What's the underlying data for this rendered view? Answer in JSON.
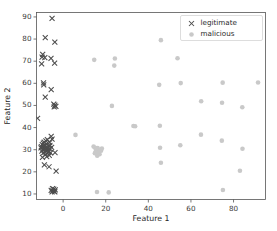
{
  "chart_data": {
    "type": "scatter",
    "title": "",
    "xlabel": "Feature 1",
    "ylabel": "Feature 2",
    "xlim": [
      -12.5,
      95
    ],
    "ylim": [
      7.5,
      92
    ],
    "xticks": [
      0,
      20,
      40,
      60,
      80
    ],
    "yticks": [
      10,
      20,
      30,
      40,
      50,
      60,
      70,
      80,
      90
    ],
    "grid": false,
    "legend_position": "upper right",
    "series": [
      {
        "name": "legitimate",
        "marker": "x",
        "color": "#4d4d4d",
        "points": [
          [
            -5.2,
            89.4
          ],
          [
            -8.4,
            80.7
          ],
          [
            -3.9,
            78.6
          ],
          [
            -9.6,
            73.1
          ],
          [
            -9.9,
            71.8
          ],
          [
            -8.6,
            71.6
          ],
          [
            -10.1,
            68.8
          ],
          [
            -5.7,
            71.3
          ],
          [
            -4.0,
            69.1
          ],
          [
            -9.2,
            60.2
          ],
          [
            -9.1,
            59.3
          ],
          [
            -5.6,
            57.2
          ],
          [
            -8.4,
            53.8
          ],
          [
            -4.4,
            50.6
          ],
          [
            -3.9,
            50.2
          ],
          [
            -3.4,
            49.6
          ],
          [
            -4.2,
            49.4
          ],
          [
            -12.0,
            44.2
          ],
          [
            -5.6,
            36.0
          ],
          [
            -5.2,
            34.8
          ],
          [
            -7.4,
            34.6
          ],
          [
            -8.9,
            33.4
          ],
          [
            -6.3,
            33.2
          ],
          [
            -7.9,
            32.6
          ],
          [
            -9.8,
            32.3
          ],
          [
            -8.2,
            31.9
          ],
          [
            -6.7,
            31.6
          ],
          [
            -9.1,
            31.2
          ],
          [
            -7.6,
            31.0
          ],
          [
            -10.4,
            30.8
          ],
          [
            -8.7,
            30.6
          ],
          [
            -6.1,
            30.4
          ],
          [
            -9.4,
            30.1
          ],
          [
            -7.2,
            29.9
          ],
          [
            -8.0,
            29.6
          ],
          [
            -10.0,
            29.4
          ],
          [
            -6.9,
            29.2
          ],
          [
            -8.6,
            28.9
          ],
          [
            -7.0,
            28.7
          ],
          [
            -9.5,
            28.4
          ],
          [
            -5.9,
            28.6
          ],
          [
            -3.8,
            28.7
          ],
          [
            -8.3,
            27.8
          ],
          [
            -6.5,
            27.4
          ],
          [
            -7.7,
            26.9
          ],
          [
            -9.0,
            31.8
          ],
          [
            -8.9,
            30.0
          ],
          [
            -7.3,
            30.7
          ],
          [
            -6.2,
            32.0
          ],
          [
            -9.3,
            33.0
          ],
          [
            -8.1,
            34.0
          ],
          [
            -10.2,
            31.4
          ],
          [
            -5.4,
            31.0
          ],
          [
            -9.7,
            26.5
          ],
          [
            -8.8,
            23.2
          ],
          [
            -6.6,
            22.3
          ],
          [
            -3.3,
            20.3
          ],
          [
            -5.0,
            12.4
          ],
          [
            -4.4,
            12.2
          ],
          [
            -3.7,
            11.9
          ],
          [
            -5.6,
            11.6
          ],
          [
            -4.8,
            11.4
          ],
          [
            -4.1,
            11.2
          ],
          [
            -5.2,
            10.9
          ],
          [
            -3.9,
            11.0
          ]
        ]
      },
      {
        "name": "malicious",
        "marker": "o",
        "color": "#c9c9c9",
        "points": [
          [
            45.9,
            79.5
          ],
          [
            14.6,
            70.6
          ],
          [
            24.3,
            71.2
          ],
          [
            53.7,
            71.3
          ],
          [
            24.0,
            68.0
          ],
          [
            45.1,
            59.3
          ],
          [
            55.2,
            60.1
          ],
          [
            74.9,
            60.3
          ],
          [
            91.5,
            60.4
          ],
          [
            64.8,
            51.9
          ],
          [
            74.6,
            51.2
          ],
          [
            84.1,
            49.2
          ],
          [
            22.9,
            49.8
          ],
          [
            33.0,
            40.7
          ],
          [
            33.8,
            40.6
          ],
          [
            45.4,
            40.8
          ],
          [
            5.8,
            36.7
          ],
          [
            64.7,
            36.8
          ],
          [
            74.5,
            34.1
          ],
          [
            55.0,
            32.0
          ],
          [
            45.5,
            30.9
          ],
          [
            84.2,
            30.4
          ],
          [
            14.3,
            31.4
          ],
          [
            15.0,
            30.9
          ],
          [
            15.6,
            30.2
          ],
          [
            16.2,
            30.7
          ],
          [
            16.9,
            29.8
          ],
          [
            17.5,
            30.1
          ],
          [
            15.3,
            29.2
          ],
          [
            16.5,
            28.6
          ],
          [
            17.1,
            28.0
          ],
          [
            16.0,
            27.3
          ],
          [
            17.8,
            29.5
          ],
          [
            14.9,
            28.4
          ],
          [
            18.2,
            30.5
          ],
          [
            45.9,
            24.1
          ],
          [
            83.0,
            20.5
          ],
          [
            15.9,
            10.9
          ],
          [
            21.4,
            10.7
          ],
          [
            75.0,
            11.8
          ]
        ]
      }
    ]
  }
}
